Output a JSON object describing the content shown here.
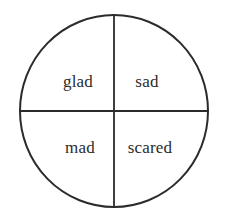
{
  "diagram": {
    "kind": "quadrant-circle-diagram",
    "background_color": "#ffffff",
    "stroke_color": "#2b2b2b",
    "text_color": "#2b2b2b",
    "circle": {
      "center_x": 114,
      "center_y": 111,
      "radius_x": 94,
      "radius_y": 96,
      "stroke_width": 2
    },
    "dividers": [
      {
        "name": "vertical-diameter",
        "orientation": "vertical",
        "position": 114
      },
      {
        "name": "horizontal-diameter",
        "orientation": "horizontal",
        "position": 111
      }
    ],
    "quadrants": [
      {
        "id": "top-left",
        "label": "glad"
      },
      {
        "id": "top-right",
        "label": "sad"
      },
      {
        "id": "bottom-left",
        "label": "mad"
      },
      {
        "id": "bottom-right",
        "label": "scared"
      }
    ]
  }
}
